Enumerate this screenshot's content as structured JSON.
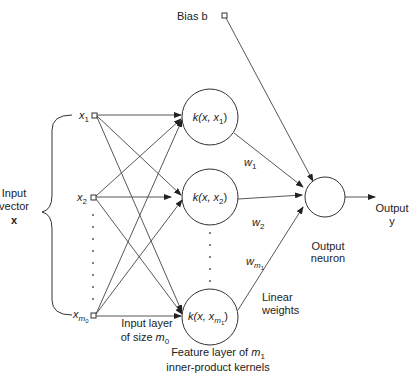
{
  "diagram": {
    "type": "rbf-style network with inner-product kernels",
    "bias": {
      "label": "Bias b"
    },
    "inputs": {
      "group_label_line1": "Input",
      "group_label_line2": "vector",
      "group_label_line3": "x",
      "nodes": [
        {
          "sym": "x",
          "sub": "1"
        },
        {
          "sym": "x",
          "sub": "2"
        },
        {
          "sym": "x",
          "sub": "m",
          "subsub": "0"
        }
      ],
      "layer_label_line1": "Input layer",
      "layer_label_line2_prefix": "of size ",
      "layer_label_line2_sym": "m",
      "layer_label_line2_sub": "0"
    },
    "kernels": {
      "nodes": [
        {
          "prefix": "k(x, x",
          "sub": "1",
          "suffix": ")"
        },
        {
          "prefix": "k(x, x",
          "sub": "2",
          "suffix": ")"
        },
        {
          "prefix": "k(x, x",
          "sub": "m",
          "subsub": "1",
          "suffix": ")"
        }
      ],
      "layer_label_line1_prefix": "Feature layer of ",
      "layer_label_line1_sym": "m",
      "layer_label_line1_sub": "1",
      "layer_label_line2": "inner-product kernels"
    },
    "weights": {
      "w1": {
        "sym": "w",
        "sub": "1"
      },
      "w2": {
        "sym": "w",
        "sub": "2"
      },
      "wm1": {
        "sym": "w",
        "sub": "m",
        "subsub": "1"
      },
      "label_line1": "Linear",
      "label_line2": "weights"
    },
    "output_neuron": {
      "label_line1": "Output",
      "label_line2": "neuron"
    },
    "output": {
      "label_line1": "Output",
      "label_line2": "y"
    },
    "colors": {
      "stroke": "#333333",
      "background": "#ffffff"
    }
  }
}
